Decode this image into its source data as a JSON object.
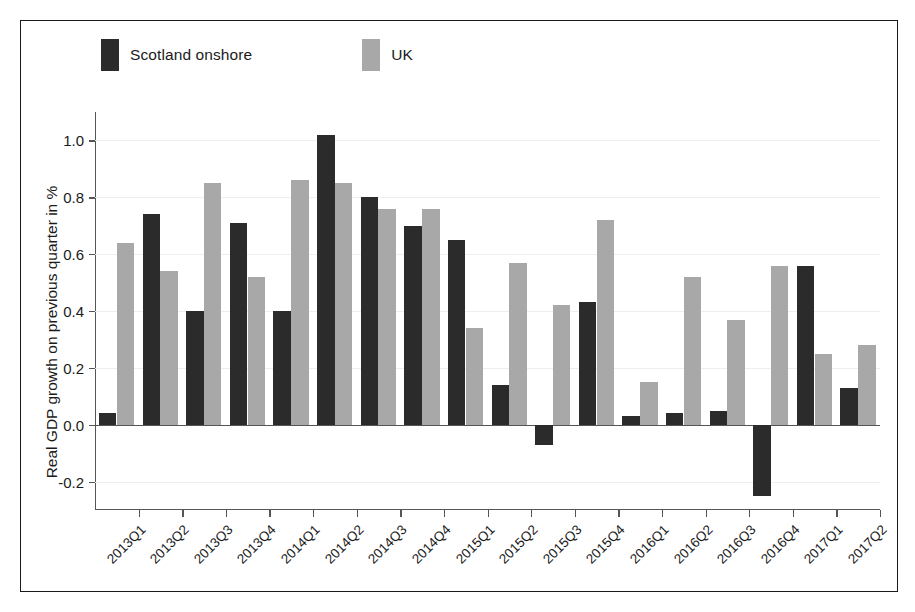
{
  "legend": {
    "items": [
      {
        "label": "Scotland onshore",
        "color": "#2b2b2b",
        "key": "scotland"
      },
      {
        "label": "UK",
        "color": "#a8a8a8",
        "key": "uk"
      }
    ]
  },
  "axis": {
    "y_title": "Real GDP growth on previous quarter in %",
    "y_ticks": [
      "1.0",
      "0.8",
      "0.6",
      "0.4",
      "0.2",
      "0.0",
      "-0.2"
    ]
  },
  "chart_data": {
    "type": "bar",
    "title": "",
    "xlabel": "",
    "ylabel": "Real GDP growth on previous quarter in %",
    "ylim": [
      -0.3,
      1.1
    ],
    "yticks": [
      1.0,
      0.8,
      0.6,
      0.4,
      0.2,
      0.0,
      -0.2
    ],
    "grid": true,
    "legend_position": "top",
    "categories": [
      "2013Q1",
      "2013Q2",
      "2013Q3",
      "2013Q4",
      "2014Q1",
      "2014Q2",
      "2014Q3",
      "2014Q4",
      "2015Q1",
      "2015Q2",
      "2015Q3",
      "2015Q4",
      "2016Q1",
      "2016Q2",
      "2016Q3",
      "2016Q4",
      "2017Q1",
      "2017Q2"
    ],
    "series": [
      {
        "name": "Scotland onshore",
        "color": "#2b2b2b",
        "values": [
          0.04,
          0.74,
          0.4,
          0.71,
          0.4,
          1.02,
          0.8,
          0.7,
          0.65,
          0.14,
          -0.07,
          0.43,
          0.03,
          0.04,
          0.05,
          -0.25,
          0.56,
          0.13
        ]
      },
      {
        "name": "UK",
        "color": "#a8a8a8",
        "values": [
          0.64,
          0.54,
          0.85,
          0.52,
          0.86,
          0.85,
          0.76,
          0.76,
          0.34,
          0.57,
          0.42,
          0.72,
          0.15,
          0.52,
          0.37,
          0.56,
          0.25,
          0.28
        ]
      }
    ]
  }
}
